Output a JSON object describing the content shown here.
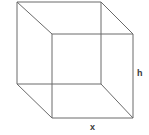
{
  "figure": {
    "type": "line-drawing",
    "background_color": "#ffffff",
    "line_color": "#6a6a6a",
    "line_width": 1,
    "labels": [
      {
        "id": "height",
        "text": "h",
        "position": "right-side",
        "describes": "vertical edge of the front face",
        "color": "#3a3a3a"
      },
      {
        "id": "width",
        "text": "x",
        "position": "bottom-center",
        "describes": "bottom edge of the front face",
        "color": "#3a3a3a"
      }
    ],
    "geometry": {
      "projection": "oblique",
      "back_face": {
        "name": "back-square",
        "points": "17,2 101,2 101,84 17,84",
        "corners": {
          "top_left": [
            17,
            2
          ],
          "top_right": [
            101,
            2
          ],
          "bottom_right": [
            101,
            84
          ],
          "bottom_left": [
            17,
            84
          ]
        }
      },
      "front_face": {
        "name": "front-square",
        "points": "52,34 133,34 133,118 52,118",
        "corners": {
          "top_left": [
            52,
            34
          ],
          "top_right": [
            133,
            34
          ],
          "bottom_right": [
            133,
            118
          ],
          "bottom_left": [
            52,
            118
          ]
        }
      },
      "connecting_edges": [
        {
          "name": "edge-top-left",
          "from": [
            17,
            2
          ],
          "to": [
            52,
            34
          ]
        },
        {
          "name": "edge-top-right",
          "from": [
            101,
            2
          ],
          "to": [
            133,
            34
          ]
        },
        {
          "name": "edge-bottom-right",
          "from": [
            101,
            84
          ],
          "to": [
            133,
            118
          ]
        },
        {
          "name": "edge-bottom-left",
          "from": [
            17,
            84
          ],
          "to": [
            52,
            118
          ]
        }
      ]
    }
  }
}
